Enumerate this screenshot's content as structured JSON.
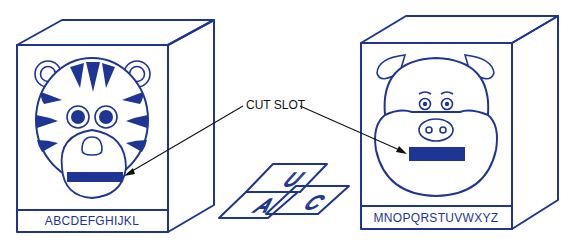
{
  "diagram": {
    "type": "illustration",
    "colors": {
      "ink": "#1e3596",
      "leader": "#111111",
      "background": "#ffffff"
    },
    "callout": {
      "label": "CUT SLOT"
    },
    "left_box": {
      "animal": "tiger",
      "label": "ABCDEFGHIJKL"
    },
    "right_box": {
      "animal": "pig",
      "label": "MNOPQRSTUVWXYZ"
    },
    "cards": [
      {
        "letter": "U"
      },
      {
        "letter": "A"
      },
      {
        "letter": "C"
      }
    ]
  }
}
